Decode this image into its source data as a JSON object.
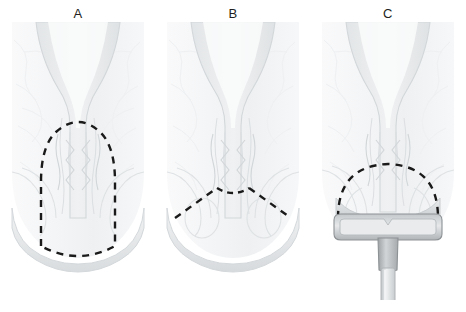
{
  "figure": {
    "background_color": "#ffffff",
    "width": 466,
    "height": 312,
    "caption_artifact": ""
  },
  "style": {
    "tissue_fill": "#f7f8f9",
    "tissue_outline": "#d6dadd",
    "tissue_shade": "#e3e6e8",
    "mucosa_fill": "#eceef0",
    "dashed_line_color": "#1a1a1a",
    "label_color": "#231f20",
    "instrument_body": "#a9adb0",
    "instrument_light": "#d9dcde",
    "instrument_shaft": "#c9cdd0",
    "instrument_outline": "#8d9295"
  },
  "panels": [
    {
      "id": "panel-a",
      "label": "A",
      "resection": {
        "name": "tall-arch-resection-line",
        "shape": "tall rounded arch enclosing the anal canal and dentate line",
        "description": "Dashed line forms a tall dome from the rectal wall down across the anal verge"
      },
      "instrument": null
    },
    {
      "id": "panel-b",
      "label": "B",
      "resection": {
        "name": "inverted-v-resection-line",
        "shape": "shallow inverted V with central notch",
        "description": "Dashed line angles down and outward from a small central dip just below the dentate line"
      },
      "instrument": null
    },
    {
      "id": "panel-c",
      "label": "C",
      "resection": {
        "name": "wide-dome-resection-line",
        "shape": "wide semicircular dome",
        "description": "Dashed dome spans the full width of the anal canal above the stapler head"
      },
      "instrument": {
        "name": "circular-stapler",
        "parts": [
          "stapler-head",
          "stapler-collar",
          "stapler-shaft"
        ]
      }
    }
  ]
}
